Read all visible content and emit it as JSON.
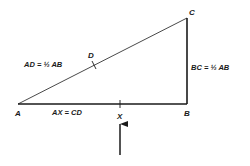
{
  "diagram": {
    "type": "right-triangle-geometry",
    "points": {
      "A": {
        "label": "A",
        "x": 18,
        "y": 104
      },
      "B": {
        "label": "B",
        "x": 187,
        "y": 104
      },
      "C": {
        "label": "C",
        "x": 187,
        "y": 18
      },
      "D": {
        "label": "D",
        "x": 94,
        "y": 65
      },
      "X": {
        "label": "X",
        "x": 120,
        "y": 104
      }
    },
    "annotations": {
      "ad": "AD = ½ AB",
      "bc": "BC = ½ AB",
      "ax": "AX = CD"
    },
    "arrow": {
      "points_to": "X"
    },
    "colors": {
      "line": "#1a1a1a",
      "background": "#ffffff"
    }
  }
}
